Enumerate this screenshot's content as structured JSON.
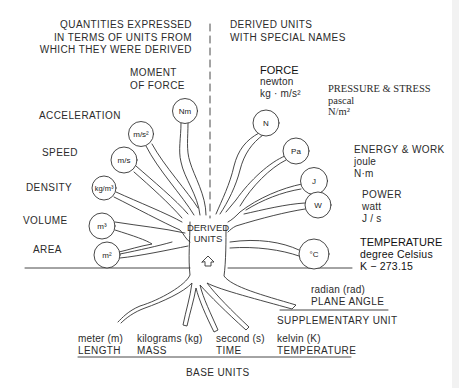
{
  "headers": {
    "left": [
      "QUANTITIES EXPRESSED",
      "IN TERMS OF UNITS FROM",
      "WHICH THEY WERE DERIVED"
    ],
    "right": [
      "DERIVED UNITS",
      "WITH SPECIAL NAMES"
    ]
  },
  "left_quantities": [
    {
      "name": "MOMENT OF FORCE",
      "lines": [
        "MOMENT",
        "OF FORCE"
      ],
      "unit": "Nm"
    },
    {
      "name": "ACCELERATION",
      "unit": "m/s²"
    },
    {
      "name": "SPEED",
      "unit": "m/s"
    },
    {
      "name": "DENSITY",
      "unit": "kg/m³"
    },
    {
      "name": "VOLUME",
      "unit": "m³"
    },
    {
      "name": "AREA",
      "unit": "m²"
    }
  ],
  "right_units": [
    {
      "quantity": "FORCE",
      "unit_name": "newton",
      "definition": "kg · m/s²",
      "symbol": "N"
    },
    {
      "quantity": "PRESSURE & STRESS",
      "unit_name": "pascal",
      "definition": "N/m²",
      "symbol": "Pa"
    },
    {
      "quantity": "ENERGY & WORK",
      "unit_name": "joule",
      "definition": "N·m",
      "symbol": "J"
    },
    {
      "quantity": "POWER",
      "unit_name": "watt",
      "definition": "J / s",
      "symbol": "W"
    },
    {
      "quantity": "TEMPERATURE",
      "unit_name": "degree Celsius",
      "definition": "K − 273.15",
      "symbol": "°C"
    }
  ],
  "center": {
    "lines": [
      "DERIVED",
      "UNITS"
    ]
  },
  "supplementary": {
    "unit": "radian (rad)",
    "quantity": "PLANE ANGLE",
    "section_label": "SUPPLEMENTARY UNIT"
  },
  "base_units": [
    {
      "unit": "meter (m)",
      "quantity": "LENGTH"
    },
    {
      "unit": "kilograms (kg)",
      "quantity": "MASS"
    },
    {
      "unit": "second (s)",
      "quantity": "TIME"
    },
    {
      "unit": "kelvin (K)",
      "quantity": "TEMPERATURE"
    }
  ],
  "base_section_label": "BASE UNITS",
  "colors": {
    "line": "#333333",
    "text": "#2b2b2b",
    "background": "#ffffff"
  }
}
